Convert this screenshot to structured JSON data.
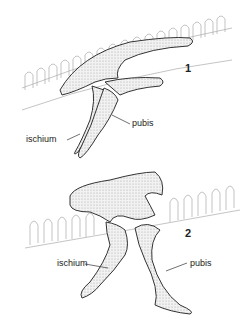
{
  "figures": [
    {
      "number": "1",
      "labels": {
        "ischium": "ischium",
        "pubis": "pubis"
      }
    },
    {
      "number": "2",
      "labels": {
        "ischium": "ischium",
        "pubis": "pubis"
      }
    }
  ],
  "colors": {
    "line": "#333333",
    "vertebrae": "#9a9a9a",
    "bone_fill": "#e4e4e4"
  }
}
